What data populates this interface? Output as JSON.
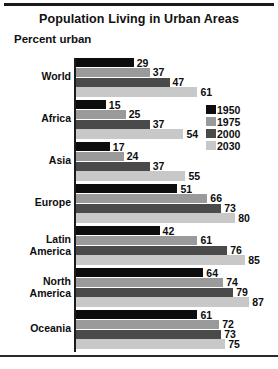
{
  "chart": {
    "title": "Population Living in Urban Areas",
    "axis_label": "Percent urban"
  },
  "legend": {
    "items": [
      {
        "label": "1950",
        "color": "#0d0d0d"
      },
      {
        "label": "1975",
        "color": "#9a9a9a"
      },
      {
        "label": "2000",
        "color": "#4a4a4a"
      },
      {
        "label": "2030",
        "color": "#c8c8c8"
      }
    ]
  },
  "chart_data": {
    "type": "bar",
    "title": "Population Living in Urban Areas",
    "xlabel": "Percent urban",
    "ylabel": "",
    "orientation": "horizontal",
    "xlim": [
      0,
      100
    ],
    "grid": false,
    "legend_position": "right",
    "categories": [
      "World",
      "Africa",
      "Asia",
      "Europe",
      "Latin America",
      "North America",
      "Oceania"
    ],
    "series": [
      {
        "name": "1950",
        "color": "#0d0d0d",
        "values": [
          29,
          15,
          17,
          51,
          42,
          64,
          61
        ]
      },
      {
        "name": "1975",
        "color": "#9a9a9a",
        "values": [
          37,
          25,
          24,
          66,
          61,
          74,
          72
        ]
      },
      {
        "name": "2000",
        "color": "#4a4a4a",
        "values": [
          47,
          37,
          37,
          73,
          76,
          79,
          73
        ]
      },
      {
        "name": "2030",
        "color": "#c8c8c8",
        "values": [
          61,
          54,
          55,
          80,
          85,
          87,
          75
        ]
      }
    ]
  }
}
